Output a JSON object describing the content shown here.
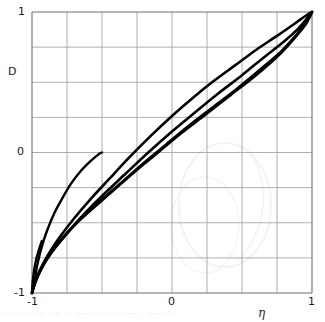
{
  "chart_data": {
    "type": "line",
    "title": "",
    "xlabel": "η",
    "ylabel": "D",
    "xlim": [
      -1,
      1
    ],
    "ylim": [
      -1,
      1
    ],
    "grid": true,
    "grid_step": 0.25,
    "legend": "none",
    "xticks": [
      {
        "value": -1,
        "label": "-1"
      },
      {
        "value": 0,
        "label": "0"
      },
      {
        "value": 1,
        "label": "1"
      }
    ],
    "yticks": [
      {
        "value": -1,
        "label": "-1"
      },
      {
        "value": 0,
        "label": "0"
      },
      {
        "value": 1,
        "label": "1"
      }
    ],
    "series": [
      {
        "name": "curve-1-upper",
        "comment": "Uppermost arc, bows above the diagonal; runs corner to corner.",
        "points": [
          [
            -1.0,
            -1.0
          ],
          [
            -0.97,
            -0.91
          ],
          [
            -0.93,
            -0.82
          ],
          [
            -0.88,
            -0.72
          ],
          [
            -0.8,
            -0.6
          ],
          [
            -0.7,
            -0.47
          ],
          [
            -0.58,
            -0.33
          ],
          [
            -0.45,
            -0.19
          ],
          [
            -0.3,
            -0.03
          ],
          [
            -0.15,
            0.12
          ],
          [
            0.0,
            0.26
          ],
          [
            0.15,
            0.39
          ],
          [
            0.3,
            0.51
          ],
          [
            0.45,
            0.62
          ],
          [
            0.6,
            0.73
          ],
          [
            0.75,
            0.83
          ],
          [
            0.88,
            0.92
          ],
          [
            0.95,
            0.97
          ],
          [
            1.0,
            1.0
          ]
        ]
      },
      {
        "name": "curve-2-middle",
        "comment": "Middle band, slightly below the diagonal.",
        "points": [
          [
            -1.0,
            -1.0
          ],
          [
            -0.98,
            -0.93
          ],
          [
            -0.95,
            -0.86
          ],
          [
            -0.9,
            -0.77
          ],
          [
            -0.83,
            -0.67
          ],
          [
            -0.73,
            -0.55
          ],
          [
            -0.62,
            -0.43
          ],
          [
            -0.48,
            -0.29
          ],
          [
            -0.33,
            -0.15
          ],
          [
            -0.17,
            0.0
          ],
          [
            0.0,
            0.15
          ],
          [
            0.17,
            0.29
          ],
          [
            0.33,
            0.42
          ],
          [
            0.5,
            0.55
          ],
          [
            0.66,
            0.68
          ],
          [
            0.8,
            0.79
          ],
          [
            0.9,
            0.88
          ],
          [
            0.96,
            0.95
          ],
          [
            1.0,
            1.0
          ]
        ]
      },
      {
        "name": "curve-3-lower",
        "comment": "Lower band, strongest sag below the diagonal.",
        "points": [
          [
            -1.0,
            -1.0
          ],
          [
            -0.99,
            -0.95
          ],
          [
            -0.96,
            -0.88
          ],
          [
            -0.92,
            -0.8
          ],
          [
            -0.86,
            -0.71
          ],
          [
            -0.77,
            -0.6
          ],
          [
            -0.66,
            -0.48
          ],
          [
            -0.53,
            -0.36
          ],
          [
            -0.38,
            -0.23
          ],
          [
            -0.22,
            -0.09
          ],
          [
            -0.05,
            0.05
          ],
          [
            0.12,
            0.19
          ],
          [
            0.29,
            0.32
          ],
          [
            0.46,
            0.45
          ],
          [
            0.63,
            0.59
          ],
          [
            0.78,
            0.72
          ],
          [
            0.89,
            0.84
          ],
          [
            0.96,
            0.93
          ],
          [
            1.0,
            1.0
          ]
        ]
      },
      {
        "name": "curve-4-lowest",
        "comment": "Lowest band, nearly overlapping curve 3 in the mid range.",
        "points": [
          [
            -1.0,
            -1.0
          ],
          [
            -0.99,
            -0.96
          ],
          [
            -0.97,
            -0.9
          ],
          [
            -0.94,
            -0.83
          ],
          [
            -0.89,
            -0.74
          ],
          [
            -0.81,
            -0.64
          ],
          [
            -0.71,
            -0.53
          ],
          [
            -0.58,
            -0.41
          ],
          [
            -0.43,
            -0.28
          ],
          [
            -0.27,
            -0.14
          ],
          [
            -0.1,
            0.0
          ],
          [
            0.07,
            0.14
          ],
          [
            0.24,
            0.27
          ],
          [
            0.42,
            0.41
          ],
          [
            0.6,
            0.55
          ],
          [
            0.76,
            0.69
          ],
          [
            0.88,
            0.82
          ],
          [
            0.96,
            0.92
          ],
          [
            1.0,
            1.0
          ]
        ]
      },
      {
        "name": "curve-5-truncated-steep",
        "comment": "Steep short branch from (-1,-1) terminating near (-0.50, 0.00).",
        "points": [
          [
            -1.0,
            -1.0
          ],
          [
            -0.98,
            -0.9
          ],
          [
            -0.96,
            -0.79
          ],
          [
            -0.93,
            -0.67
          ],
          [
            -0.89,
            -0.55
          ],
          [
            -0.84,
            -0.43
          ],
          [
            -0.78,
            -0.32
          ],
          [
            -0.72,
            -0.22
          ],
          [
            -0.65,
            -0.13
          ],
          [
            -0.58,
            -0.06
          ],
          [
            -0.52,
            -0.01
          ],
          [
            -0.5,
            0.0
          ]
        ]
      },
      {
        "name": "curve-6-truncated-short",
        "comment": "Very short steep stub from (-1,-1) terminating near (-0.93, -0.63).",
        "points": [
          [
            -1.0,
            -1.0
          ],
          [
            -0.995,
            -0.92
          ],
          [
            -0.985,
            -0.84
          ],
          [
            -0.97,
            -0.76
          ],
          [
            -0.95,
            -0.69
          ],
          [
            -0.93,
            -0.63
          ]
        ]
      }
    ]
  },
  "caption": {
    "smudge_text": "·· ···· ······ ···· ·· ······   ··· ·· ····· · ······ ··"
  },
  "style": {
    "curve_color": "#000000",
    "grid_color": "#9a9a9a",
    "axis_color": "#6e6e6e",
    "text_color": "#1a1a1a",
    "background": "#ffffff"
  }
}
